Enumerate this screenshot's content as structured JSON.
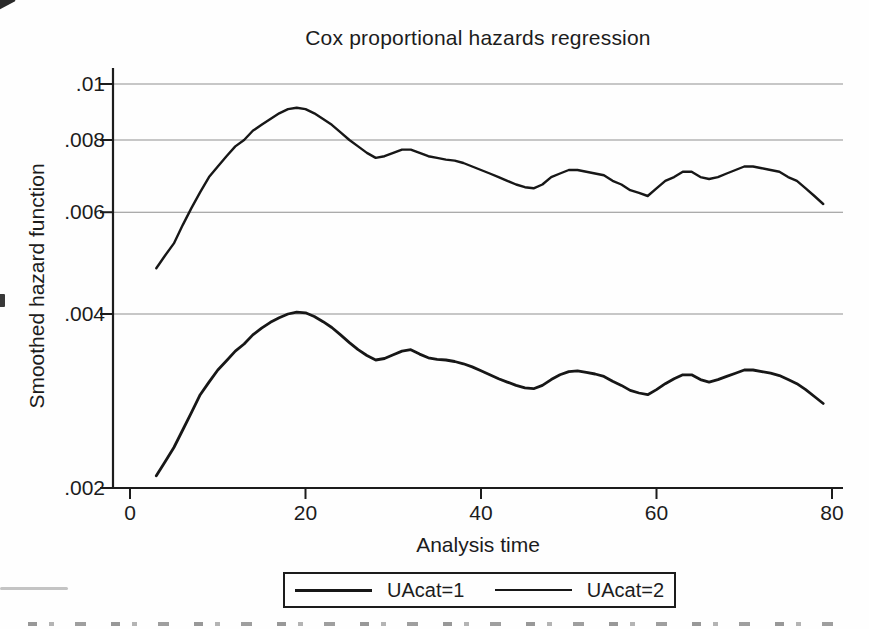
{
  "figure": {
    "title": "Cox proportional hazards regression",
    "xlabel": "Analysis time",
    "ylabel": "Smoothed hazard function"
  },
  "legend": {
    "position": "bottom-center",
    "entries": [
      {
        "label": "UAcat=1",
        "sample": "line"
      },
      {
        "label": "UAcat=2",
        "sample": "line"
      }
    ]
  },
  "colors": {
    "curve": "#171717",
    "axis": "#1c1c1c",
    "grid": "#8f8f8f",
    "text": "#1c1c1c",
    "background": "#fefefe"
  },
  "chart_data": {
    "type": "line",
    "title": "Cox proportional hazards regression",
    "xlabel": "Analysis time",
    "ylabel": "Smoothed hazard function",
    "x_scale": "linear",
    "y_scale": "log",
    "xlim": [
      0,
      80
    ],
    "ylim": [
      0.002,
      0.01
    ],
    "x_ticks": [
      0,
      20,
      40,
      60,
      80
    ],
    "y_ticks": [
      {
        "label": ".01",
        "value": 0.01
      },
      {
        "label": ".008",
        "value": 0.008
      },
      {
        "label": ".006",
        "value": 0.006
      },
      {
        "label": ".004",
        "value": 0.004
      },
      {
        "label": ".002",
        "value": 0.002
      }
    ],
    "grid": "horizontal-only",
    "legend_position": "bottom",
    "series": [
      {
        "name": "UAcat=1",
        "points": [
          [
            3,
            0.0021
          ],
          [
            4,
            0.00222
          ],
          [
            5,
            0.00235
          ],
          [
            6,
            0.00252
          ],
          [
            7,
            0.0027
          ],
          [
            8,
            0.0029
          ],
          [
            9,
            0.00305
          ],
          [
            10,
            0.0032
          ],
          [
            11,
            0.00332
          ],
          [
            12,
            0.00345
          ],
          [
            13,
            0.00355
          ],
          [
            14,
            0.00368
          ],
          [
            15,
            0.00378
          ],
          [
            16,
            0.00387
          ],
          [
            17,
            0.00394
          ],
          [
            18,
            0.004
          ],
          [
            19,
            0.00403
          ],
          [
            20,
            0.00402
          ],
          [
            21,
            0.00396
          ],
          [
            22,
            0.00388
          ],
          [
            23,
            0.00379
          ],
          [
            24,
            0.00368
          ],
          [
            25,
            0.00357
          ],
          [
            26,
            0.00347
          ],
          [
            27,
            0.00339
          ],
          [
            28,
            0.00333
          ],
          [
            29,
            0.00335
          ],
          [
            30,
            0.0034
          ],
          [
            31,
            0.00345
          ],
          [
            32,
            0.00347
          ],
          [
            33,
            0.00341
          ],
          [
            34,
            0.00336
          ],
          [
            35,
            0.00334
          ],
          [
            36,
            0.00333
          ],
          [
            37,
            0.00331
          ],
          [
            38,
            0.00328
          ],
          [
            39,
            0.00324
          ],
          [
            40,
            0.00319
          ],
          [
            41,
            0.00314
          ],
          [
            42,
            0.00309
          ],
          [
            43,
            0.00305
          ],
          [
            44,
            0.00301
          ],
          [
            45,
            0.00298
          ],
          [
            46,
            0.00297
          ],
          [
            47,
            0.00301
          ],
          [
            48,
            0.00308
          ],
          [
            49,
            0.00314
          ],
          [
            50,
            0.00318
          ],
          [
            51,
            0.00319
          ],
          [
            52,
            0.00317
          ],
          [
            53,
            0.00315
          ],
          [
            54,
            0.00312
          ],
          [
            55,
            0.00306
          ],
          [
            56,
            0.00301
          ],
          [
            57,
            0.00295
          ],
          [
            58,
            0.00292
          ],
          [
            59,
            0.0029
          ],
          [
            60,
            0.00296
          ],
          [
            61,
            0.00303
          ],
          [
            62,
            0.00309
          ],
          [
            63,
            0.00314
          ],
          [
            64,
            0.00314
          ],
          [
            65,
            0.00308
          ],
          [
            66,
            0.00305
          ],
          [
            67,
            0.00308
          ],
          [
            68,
            0.00312
          ],
          [
            69,
            0.00316
          ],
          [
            70,
            0.0032
          ],
          [
            71,
            0.0032
          ],
          [
            72,
            0.00318
          ],
          [
            73,
            0.00316
          ],
          [
            74,
            0.00313
          ],
          [
            75,
            0.00308
          ],
          [
            76,
            0.00303
          ],
          [
            77,
            0.00296
          ],
          [
            78,
            0.00288
          ],
          [
            79,
            0.0028
          ]
        ]
      },
      {
        "name": "UAcat=2",
        "points": [
          [
            3,
            0.0048
          ],
          [
            4,
            0.00505
          ],
          [
            5,
            0.0053
          ],
          [
            6,
            0.0057
          ],
          [
            7,
            0.0061
          ],
          [
            8,
            0.0065
          ],
          [
            9,
            0.0069
          ],
          [
            10,
            0.0072
          ],
          [
            11,
            0.0075
          ],
          [
            12,
            0.0078
          ],
          [
            13,
            0.008
          ],
          [
            14,
            0.0083
          ],
          [
            15,
            0.0085
          ],
          [
            16,
            0.0087
          ],
          [
            17,
            0.0089
          ],
          [
            18,
            0.00905
          ],
          [
            19,
            0.0091
          ],
          [
            20,
            0.00905
          ],
          [
            21,
            0.0089
          ],
          [
            22,
            0.0087
          ],
          [
            23,
            0.0085
          ],
          [
            24,
            0.00825
          ],
          [
            25,
            0.008
          ],
          [
            26,
            0.0078
          ],
          [
            27,
            0.0076
          ],
          [
            28,
            0.00745
          ],
          [
            29,
            0.0075
          ],
          [
            30,
            0.0076
          ],
          [
            31,
            0.0077
          ],
          [
            32,
            0.0077
          ],
          [
            33,
            0.0076
          ],
          [
            34,
            0.0075
          ],
          [
            35,
            0.00745
          ],
          [
            36,
            0.0074
          ],
          [
            37,
            0.00737
          ],
          [
            38,
            0.0073
          ],
          [
            39,
            0.0072
          ],
          [
            40,
            0.0071
          ],
          [
            41,
            0.007
          ],
          [
            42,
            0.0069
          ],
          [
            43,
            0.0068
          ],
          [
            44,
            0.0067
          ],
          [
            45,
            0.00663
          ],
          [
            46,
            0.0066
          ],
          [
            47,
            0.0067
          ],
          [
            48,
            0.0069
          ],
          [
            49,
            0.007
          ],
          [
            50,
            0.0071
          ],
          [
            51,
            0.0071
          ],
          [
            52,
            0.00705
          ],
          [
            53,
            0.007
          ],
          [
            54,
            0.00695
          ],
          [
            55,
            0.0068
          ],
          [
            56,
            0.0067
          ],
          [
            57,
            0.00655
          ],
          [
            58,
            0.00648
          ],
          [
            59,
            0.0064
          ],
          [
            60,
            0.0066
          ],
          [
            61,
            0.0068
          ],
          [
            62,
            0.0069
          ],
          [
            63,
            0.00705
          ],
          [
            64,
            0.00705
          ],
          [
            65,
            0.0069
          ],
          [
            66,
            0.00685
          ],
          [
            67,
            0.0069
          ],
          [
            68,
            0.007
          ],
          [
            69,
            0.0071
          ],
          [
            70,
            0.0072
          ],
          [
            71,
            0.0072
          ],
          [
            72,
            0.00715
          ],
          [
            73,
            0.0071
          ],
          [
            74,
            0.00705
          ],
          [
            75,
            0.0069
          ],
          [
            76,
            0.0068
          ],
          [
            77,
            0.0066
          ],
          [
            78,
            0.0064
          ],
          [
            79,
            0.0062
          ]
        ]
      }
    ]
  }
}
